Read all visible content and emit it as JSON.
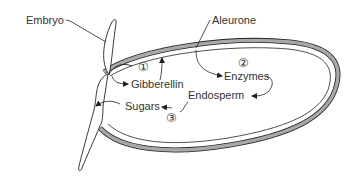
{
  "diagram": {
    "type": "seed-germination",
    "colors": {
      "stroke": "#222222",
      "aleurone_fill": "#a8a8a8",
      "text": "#333333",
      "background": "#ffffff"
    },
    "labels": {
      "embryo": "Embryo",
      "aleurone": "Aleurone",
      "gibberellin": "Gibberellin",
      "enzymes": "Enzymes",
      "endosperm": "Endosperm",
      "sugars": "Sugars"
    },
    "steps": [
      {
        "number": "1",
        "symbol": "①",
        "from": "Embryo",
        "to": "Gibberellin"
      },
      {
        "number": "2",
        "symbol": "②",
        "from": "Aleurone",
        "to": "Enzymes"
      },
      {
        "number": "3",
        "symbol": "③",
        "from": "Endosperm",
        "to": "Sugars"
      }
    ]
  }
}
